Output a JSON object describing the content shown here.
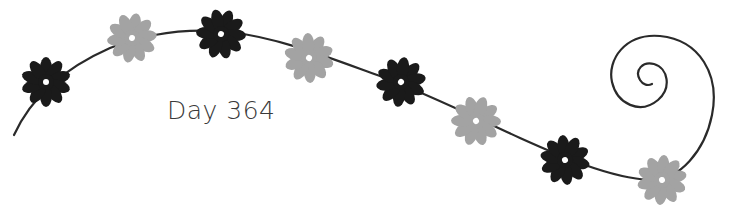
{
  "caption": "Day 364",
  "colors": {
    "vine": "#2a2a2a",
    "dark_flower": "#1a1a1a",
    "light_flower": "#a3a3a3",
    "text": "#3a3a3a",
    "background": "#ffffff"
  },
  "flowers": [
    {
      "cx": 46,
      "cy": 82,
      "tone": "dark"
    },
    {
      "cx": 132,
      "cy": 38,
      "tone": "light"
    },
    {
      "cx": 221,
      "cy": 34,
      "tone": "dark"
    },
    {
      "cx": 309,
      "cy": 58,
      "tone": "light"
    },
    {
      "cx": 401,
      "cy": 82,
      "tone": "dark"
    },
    {
      "cx": 476,
      "cy": 121,
      "tone": "light"
    },
    {
      "cx": 565,
      "cy": 160,
      "tone": "dark"
    },
    {
      "cx": 662,
      "cy": 180,
      "tone": "light"
    }
  ]
}
